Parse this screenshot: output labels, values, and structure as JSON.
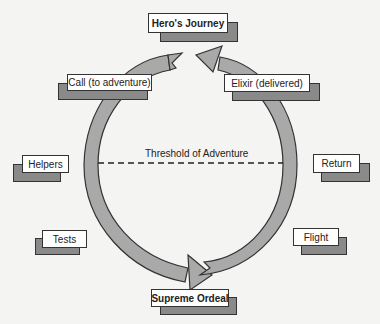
{
  "title": "Hero's Journey",
  "threshold": "Threshold of Adventure",
  "stages": {
    "call": "Call (to adventure)",
    "elixir": "Elixir (delivered)",
    "helpers": "Helpers",
    "return": "Return",
    "tests": "Tests",
    "flight": "Flight",
    "ordeal": "Supreme Ordeal"
  },
  "colors": {
    "ring_fill": "#a9a9a9",
    "ring_stroke": "#333333",
    "shadow": "#8a8a8a",
    "background": "#f4f4f2"
  }
}
